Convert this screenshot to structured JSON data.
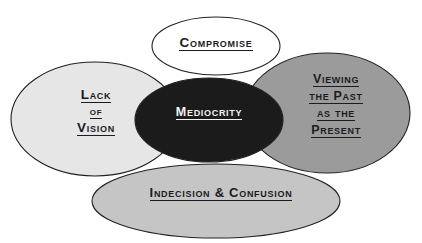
{
  "diagram": {
    "type": "venn-petal-diagram",
    "background_color": "#ffffff",
    "outline_color": "#231f20",
    "nodes": [
      {
        "id": "compromise",
        "label": "Compromise",
        "lines": [
          "Compromise"
        ],
        "fill": "#ffffff",
        "text_color": "#1b1b22",
        "position": "top"
      },
      {
        "id": "lack-of-vision",
        "label": "Lack of Vision",
        "lines": [
          "Lack",
          "of",
          "Vision"
        ],
        "fill": "#e6e6e6",
        "text_color": "#1b1b22",
        "position": "left"
      },
      {
        "id": "mediocrity",
        "label": "Mediocrity",
        "lines": [
          "Mediocrity"
        ],
        "fill": "#1c1b1b",
        "text_color": "#f2f2f2",
        "position": "center"
      },
      {
        "id": "viewing-the-past-as-the-present",
        "label": "Viewing the Past as the Present",
        "lines": [
          "Viewing",
          "the Past",
          "as the",
          "Present"
        ],
        "fill": "#9b9b9b",
        "text_color": "#1b1b22",
        "position": "right"
      },
      {
        "id": "indecision-and-confusion",
        "label": "Indecision & Confusion",
        "lines": [
          "Indecision & Confusion"
        ],
        "fill": "#c5c5c5",
        "text_color": "#1b1b22",
        "position": "bottom"
      }
    ]
  }
}
